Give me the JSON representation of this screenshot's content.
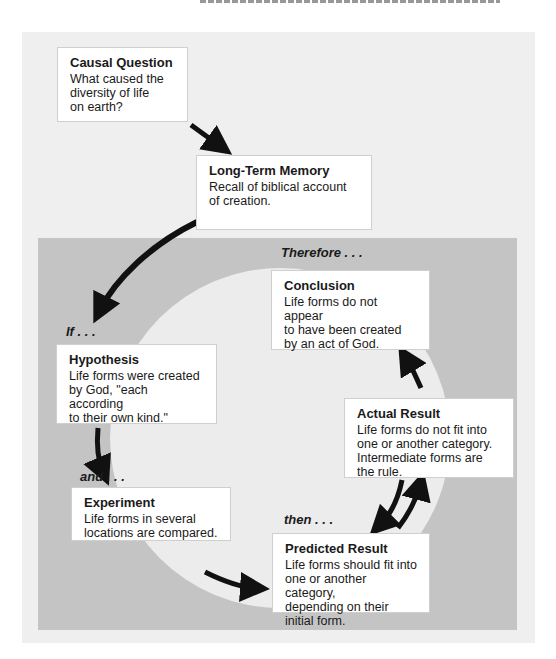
{
  "diagram": {
    "boxes": {
      "causal_question": {
        "title": "Causal Question",
        "body": "What caused the\ndiversity of life\non earth?"
      },
      "long_term_memory": {
        "title": "Long-Term Memory",
        "body": "Recall of biblical account\nof creation."
      },
      "conclusion": {
        "title": "Conclusion",
        "body": "Life forms do not appear\nto have been created\nby an act of God."
      },
      "hypothesis": {
        "title": "Hypothesis",
        "body": "Life forms were created\nby God, \"each according\nto their own kind.\""
      },
      "actual_result": {
        "title": "Actual Result",
        "body": "Life forms do not fit into\none or another category.\nIntermediate forms are\nthe rule."
      },
      "experiment": {
        "title": "Experiment",
        "body": "Life forms in several\nlocations are compared."
      },
      "predicted_result": {
        "title": "Predicted Result",
        "body": "Life forms should fit into\none or another category,\ndepending on their\ninitial form."
      }
    },
    "connectors": {
      "therefore": "Therefore . . .",
      "if": "If . . .",
      "and": "and . . .",
      "then": "then . . ."
    },
    "colors": {
      "outer_panel": "#efefef",
      "inner_panel": "#c4c4c4",
      "circle": "#ececec",
      "arrow": "#111111"
    }
  }
}
